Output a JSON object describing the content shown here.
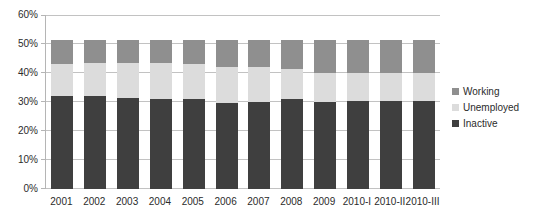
{
  "chart_data": {
    "type": "bar",
    "stacked": true,
    "title": "",
    "xlabel": "",
    "ylabel": "",
    "grid": true,
    "categories": [
      "2001",
      "2002",
      "2003",
      "2004",
      "2005",
      "2006",
      "2007",
      "2008",
      "2009",
      "2010-I",
      "2010-II",
      "2010-III"
    ],
    "series": [
      {
        "name": "Inactive",
        "color": "#3f3f3f",
        "values": [
          32,
          32,
          31.5,
          31,
          31,
          29.5,
          30,
          31,
          30,
          30.5,
          30.5,
          30.5
        ]
      },
      {
        "name": "Unemployed",
        "color": "#dcdcdc",
        "values": [
          11,
          11.5,
          12,
          12.5,
          12,
          12.5,
          12,
          10.5,
          10,
          9.5,
          9.5,
          9.5
        ]
      },
      {
        "name": "Working",
        "color": "#8f8f8f",
        "values": [
          8.5,
          8,
          8,
          8,
          8.5,
          9.5,
          9.5,
          10,
          11.5,
          11.5,
          11.5,
          11.5
        ]
      }
    ],
    "y_axis": {
      "min": 0,
      "max": 60,
      "step": 10,
      "labels": [
        "0%",
        "10%",
        "20%",
        "30%",
        "40%",
        "50%",
        "60%"
      ]
    },
    "legend": {
      "position": "right",
      "order": [
        "Working",
        "Unemployed",
        "Inactive"
      ]
    }
  },
  "colors": {
    "background": "#ffffff",
    "gridline": "#c2c2c2",
    "axis_line": "#b5b5b5",
    "text": "#2b2b2b"
  }
}
